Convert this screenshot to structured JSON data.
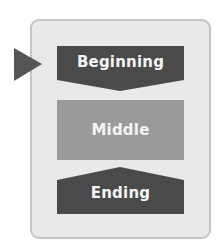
{
  "diagram": {
    "type": "narrative-structure",
    "stages": [
      {
        "id": "beginning",
        "label": "Beginning",
        "shape": "down-chevron-box",
        "color": "#4a4a4a"
      },
      {
        "id": "middle",
        "label": "Middle",
        "shape": "rectangle",
        "color": "#9a9a9a"
      },
      {
        "id": "ending",
        "label": "Ending",
        "shape": "up-pentagon-box",
        "color": "#4a4a4a"
      }
    ],
    "entry_marker": {
      "shape": "right-pointing-triangle",
      "color": "#555555",
      "points_to": "beginning"
    },
    "frame": {
      "fill": "#e9e9e9",
      "border": "#c4c4c4"
    }
  }
}
